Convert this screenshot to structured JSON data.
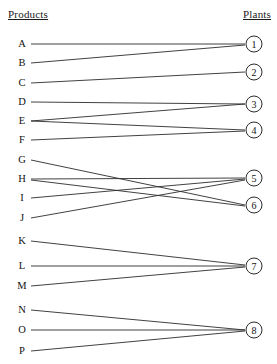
{
  "headers": {
    "left": "Products",
    "right": "Plants"
  },
  "products": [
    {
      "label": "A",
      "x": 22,
      "y": 44
    },
    {
      "label": "B",
      "x": 22,
      "y": 63
    },
    {
      "label": "C",
      "x": 22,
      "y": 83
    },
    {
      "label": "D",
      "x": 22,
      "y": 102
    },
    {
      "label": "E",
      "x": 22,
      "y": 121
    },
    {
      "label": "F",
      "x": 22,
      "y": 140
    },
    {
      "label": "G",
      "x": 22,
      "y": 160
    },
    {
      "label": "H",
      "x": 22,
      "y": 179
    },
    {
      "label": "I",
      "x": 22,
      "y": 198
    },
    {
      "label": "J",
      "x": 22,
      "y": 218
    },
    {
      "label": "K",
      "x": 22,
      "y": 241
    },
    {
      "label": "L",
      "x": 22,
      "y": 266
    },
    {
      "label": "M",
      "x": 22,
      "y": 286
    },
    {
      "label": "N",
      "x": 22,
      "y": 310
    },
    {
      "label": "O",
      "x": 22,
      "y": 330
    },
    {
      "label": "P",
      "x": 22,
      "y": 351
    }
  ],
  "plants": [
    {
      "label": "1",
      "x": 254,
      "y": 44
    },
    {
      "label": "2",
      "x": 254,
      "y": 72
    },
    {
      "label": "3",
      "x": 254,
      "y": 104
    },
    {
      "label": "4",
      "x": 254,
      "y": 130
    },
    {
      "label": "5",
      "x": 254,
      "y": 178
    },
    {
      "label": "6",
      "x": 254,
      "y": 205
    },
    {
      "label": "7",
      "x": 254,
      "y": 266
    },
    {
      "label": "8",
      "x": 254,
      "y": 330
    }
  ],
  "edges": [
    {
      "from": "A",
      "to": "1",
      "x1": 31,
      "y1": 44,
      "x2": 245,
      "y2": 44
    },
    {
      "from": "B",
      "to": "1",
      "x1": 31,
      "y1": 63,
      "x2": 245,
      "y2": 45
    },
    {
      "from": "C",
      "to": "2",
      "x1": 31,
      "y1": 83,
      "x2": 245,
      "y2": 72
    },
    {
      "from": "D",
      "to": "3",
      "x1": 31,
      "y1": 102,
      "x2": 245,
      "y2": 104
    },
    {
      "from": "E",
      "to": "3",
      "x1": 31,
      "y1": 121,
      "x2": 245,
      "y2": 104
    },
    {
      "from": "E",
      "to": "4",
      "x1": 31,
      "y1": 121,
      "x2": 245,
      "y2": 130
    },
    {
      "from": "F",
      "to": "4",
      "x1": 31,
      "y1": 140,
      "x2": 245,
      "y2": 131
    },
    {
      "from": "G",
      "to": "6",
      "x1": 31,
      "y1": 160,
      "x2": 245,
      "y2": 205
    },
    {
      "from": "H",
      "to": "5",
      "x1": 31,
      "y1": 179,
      "x2": 245,
      "y2": 178
    },
    {
      "from": "H",
      "to": "6",
      "x1": 31,
      "y1": 180,
      "x2": 245,
      "y2": 206
    },
    {
      "from": "I",
      "to": "5",
      "x1": 31,
      "y1": 198,
      "x2": 245,
      "y2": 179
    },
    {
      "from": "J",
      "to": "5",
      "x1": 31,
      "y1": 218,
      "x2": 245,
      "y2": 180
    },
    {
      "from": "K",
      "to": "7",
      "x1": 31,
      "y1": 241,
      "x2": 245,
      "y2": 265
    },
    {
      "from": "L",
      "to": "7",
      "x1": 31,
      "y1": 266,
      "x2": 245,
      "y2": 266
    },
    {
      "from": "M",
      "to": "7",
      "x1": 31,
      "y1": 286,
      "x2": 245,
      "y2": 267
    },
    {
      "from": "N",
      "to": "8",
      "x1": 31,
      "y1": 310,
      "x2": 245,
      "y2": 330
    },
    {
      "from": "O",
      "to": "8",
      "x1": 31,
      "y1": 330,
      "x2": 245,
      "y2": 330
    },
    {
      "from": "P",
      "to": "8",
      "x1": 31,
      "y1": 351,
      "x2": 245,
      "y2": 331
    }
  ],
  "style": {
    "line_color": "#2b2b2b",
    "text_color": "#111111",
    "background": "#ffffff"
  }
}
